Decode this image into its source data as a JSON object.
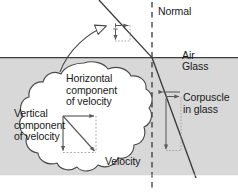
{
  "figure": {
    "labels": {
      "normal": "Normal",
      "air": "Air",
      "glass": "Glass",
      "corpuscle": "Corpuscle\nin glass",
      "horizontal_component": "Horizontal\ncomponent\nof velocity",
      "vertical_component": "Vertical\ncomponent\nof velocity",
      "velocity": "Velocity"
    },
    "colors": {
      "glass_fill": "#d8d8d8",
      "callout_fill": "#ffffff",
      "stroke": "#4a4a4a",
      "ray": "#3a3a3a",
      "dotted": "#9a9a9a",
      "text": "#1a1a1a",
      "background": "#ffffff"
    },
    "regions": [
      {
        "name": "air",
        "label": "Air",
        "fill": "#ffffff"
      },
      {
        "name": "glass",
        "label": "Glass",
        "fill": "#d8d8d8"
      }
    ],
    "elements": [
      {
        "name": "incident-ray",
        "description": "Light corpuscle path in air travelling down-right toward the interface"
      },
      {
        "name": "refracted-ray",
        "description": "Steeper corpuscle path inside the glass, bent toward the normal"
      },
      {
        "name": "normal-line",
        "description": "Vertical dashed normal at the point of incidence"
      },
      {
        "name": "interface-line",
        "description": "Horizontal air-glass boundary"
      },
      {
        "name": "air-velocity-components",
        "description": "Small horizontal and vertical component arrows on the incident ray"
      },
      {
        "name": "glass-velocity-components",
        "description": "Short horizontal and long vertical component arrows on the refracted ray"
      },
      {
        "name": "callout-cloud",
        "description": "Cloud-shaped magnified callout of the velocity vector in air"
      },
      {
        "name": "callout-pointer",
        "description": "Curved hollow arrow from the cloud to the incident ray"
      },
      {
        "name": "velocity-triangle",
        "description": "Right triangle: horizontal component, vertical component and resultant velocity"
      }
    ]
  }
}
